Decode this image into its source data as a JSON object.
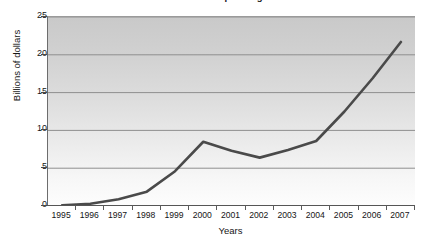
{
  "chart_data": {
    "type": "line",
    "title": "Internet Ad Spending",
    "xlabel": "Years",
    "ylabel": "Billions of dollars",
    "categories": [
      "1995",
      "1996",
      "1997",
      "1998",
      "1999",
      "2000",
      "2001",
      "2002",
      "2003",
      "2004",
      "2005",
      "2006",
      "2007"
    ],
    "x": [
      1995,
      1996,
      1997,
      1998,
      1999,
      2000,
      2001,
      2002,
      2003,
      2004,
      2005,
      2006,
      2007
    ],
    "values": [
      0.1,
      0.3,
      0.9,
      1.9,
      4.6,
      8.5,
      7.3,
      6.4,
      7.4,
      8.6,
      12.5,
      16.9,
      21.7
    ],
    "ylim": [
      0,
      25
    ],
    "yticks": [
      0,
      5,
      10,
      15,
      20,
      25
    ],
    "ytick_labels": [
      "0",
      "5",
      "10",
      "15",
      "20",
      "25"
    ],
    "grid": "horizontal",
    "legend": "none",
    "series": [
      {
        "name": "Billions of dollars",
        "color": "#4a4a4a",
        "values": [
          0.1,
          0.3,
          0.9,
          1.9,
          4.6,
          8.5,
          7.3,
          6.4,
          7.4,
          8.6,
          12.5,
          16.9,
          21.7
        ]
      }
    ],
    "colors": {
      "line": "#4a4a4a",
      "gridline": "#8f8f8f",
      "axis": "#555555",
      "plot_background_top": "#c9c9c9",
      "plot_background_bottom": "#fdfdfd",
      "figure_background": "#ffffff",
      "text": "#161616"
    }
  }
}
